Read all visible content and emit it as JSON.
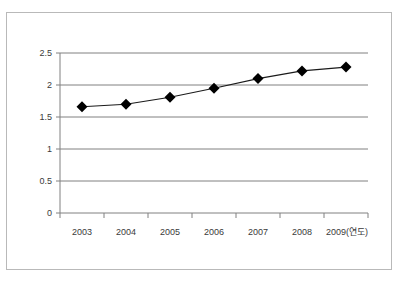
{
  "figure": {
    "frame_color": "#b9b9b9",
    "background": "#ffffff"
  },
  "chart_data": {
    "type": "line",
    "title": "",
    "subtitle": "",
    "xlabel": "(연도)",
    "ylabel": "",
    "categories": [
      "2003",
      "2004",
      "2005",
      "2006",
      "2007",
      "2008",
      "2009(연도)"
    ],
    "x_tick_labels": [
      "2003",
      "2004",
      "2005",
      "2006",
      "2007",
      "2008",
      "2009(연도)"
    ],
    "y_tick_labels": [
      "0",
      "0.5",
      "1",
      "1.5",
      "2",
      "2.5"
    ],
    "y_ticks": [
      0,
      0.5,
      1,
      1.5,
      2,
      2.5
    ],
    "ylim": [
      0,
      2.5
    ],
    "values": [
      1.66,
      1.7,
      1.81,
      1.95,
      2.1,
      2.22,
      2.28
    ],
    "series": [
      {
        "name": "series-1",
        "values": [
          1.66,
          1.7,
          1.81,
          1.95,
          2.1,
          2.22,
          2.28
        ],
        "line_color": "#1a1a1a",
        "marker": "diamond",
        "marker_color": "#000000"
      }
    ],
    "grid": true,
    "grid_axis": "y",
    "grid_color": "#808080",
    "legend": false,
    "legend_position": "none",
    "axis_color": "#808080"
  }
}
